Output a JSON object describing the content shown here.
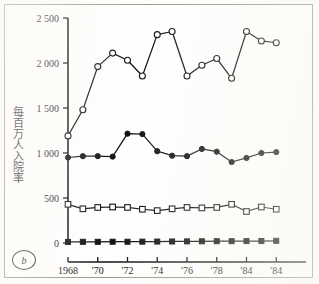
{
  "figure": {
    "panel_label": "b",
    "y_axis_title": "每百万人入院率"
  },
  "chart_data": {
    "type": "line",
    "title": "",
    "subtitle": "",
    "xlabel": "",
    "ylabel": "每百万人入院率",
    "ylim": [
      0,
      2500
    ],
    "ytick_labels": [
      "0",
      "500",
      "1 000",
      "1 500",
      "2 000",
      "2 500"
    ],
    "ytick_values": [
      0,
      500,
      1000,
      1500,
      2000,
      2500
    ],
    "xtick_labels": [
      "1968",
      "'70",
      "'72",
      "'74",
      "'76",
      "'78",
      "'84",
      "'84"
    ],
    "xtick_values": [
      1968,
      1970,
      1972,
      1974,
      1976,
      1978,
      1980,
      1982
    ],
    "x": [
      1968,
      1969,
      1970,
      1971,
      1972,
      1973,
      1974,
      1975,
      1976,
      1977,
      1978,
      1979,
      1980,
      1981,
      1982,
      1983,
      1984
    ],
    "grid": false,
    "legend_position": "none",
    "series": [
      {
        "name": "series-open-circle",
        "marker": "open-circle",
        "values": [
          1190,
          1480,
          1960,
          2110,
          2030,
          1855,
          2315,
          2350,
          1855,
          1975,
          2050,
          1830,
          2350,
          2245,
          2225,
          null,
          null
        ]
      },
      {
        "name": "series-filled-circle",
        "marker": "filled-circle",
        "values": [
          950,
          965,
          965,
          960,
          1215,
          1210,
          1020,
          970,
          965,
          1045,
          1015,
          900,
          945,
          1000,
          1010,
          null,
          null
        ]
      },
      {
        "name": "series-open-square",
        "marker": "open-square",
        "values": [
          430,
          380,
          395,
          400,
          395,
          375,
          360,
          380,
          395,
          390,
          395,
          430,
          350,
          400,
          375,
          null,
          null
        ]
      },
      {
        "name": "series-filled-square",
        "marker": "filled-square",
        "values": [
          12,
          13,
          13,
          14,
          14,
          15,
          16,
          17,
          18,
          19,
          20,
          20,
          21,
          22,
          24,
          null,
          null
        ]
      }
    ]
  }
}
